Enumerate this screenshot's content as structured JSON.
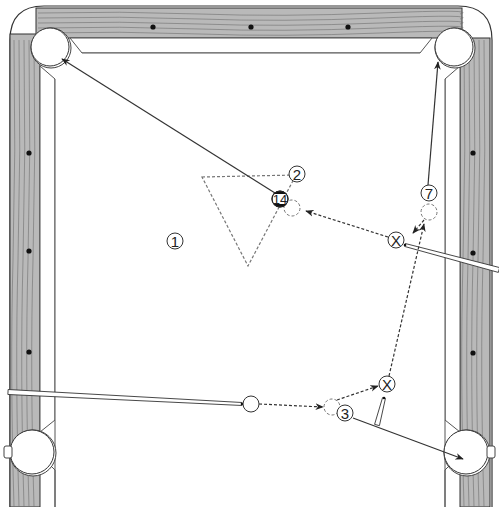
{
  "diagram": {
    "type": "billiards-shot-diagram",
    "colors": {
      "rail_wood": "#b9b9b9",
      "rail_grain": "#6e6e6e",
      "rail_outline": "#333333",
      "cloth": "#ffffff",
      "cushion_line": "#555555",
      "diamond": "#111111",
      "path_line": "#333333",
      "ghost_ball": "#777777",
      "stripe_band": "#111111"
    },
    "diamonds": {
      "top": [
        [
          153,
          27
        ],
        [
          251,
          27
        ],
        [
          348,
          27
        ]
      ],
      "left": [
        [
          29,
          153
        ],
        [
          29,
          251
        ],
        [
          29,
          352
        ]
      ],
      "right": [
        [
          473,
          153
        ],
        [
          473,
          253
        ],
        [
          473,
          353
        ]
      ]
    },
    "pockets": [
      {
        "id": "top-left",
        "cx": 50,
        "cy": 47,
        "r": 19
      },
      {
        "id": "top-right",
        "cx": 454,
        "cy": 47,
        "r": 19
      },
      {
        "id": "bottom-left",
        "cx": 32,
        "cy": 452,
        "r": 22
      },
      {
        "id": "bottom-right",
        "cx": 466,
        "cy": 452,
        "r": 22
      }
    ],
    "balls": [
      {
        "id": "ball-1",
        "label": "1",
        "cx": 175,
        "cy": 241,
        "r": 8,
        "style": "solid"
      },
      {
        "id": "ball-2",
        "label": "2",
        "cx": 297,
        "cy": 174,
        "r": 8,
        "style": "solid"
      },
      {
        "id": "ball-14",
        "label": "14",
        "cx": 280,
        "cy": 199,
        "r": 8,
        "style": "stripe"
      },
      {
        "id": "ball-7",
        "label": "7",
        "cx": 429,
        "cy": 193,
        "r": 8,
        "style": "solid"
      },
      {
        "id": "ball-3",
        "label": "3",
        "cx": 345,
        "cy": 413,
        "r": 8,
        "style": "solid"
      },
      {
        "id": "cue-ball",
        "label": "",
        "cx": 251,
        "cy": 404,
        "r": 8,
        "style": "cue"
      }
    ],
    "cue_ball_positions": [
      {
        "id": "cue-position-x-upper",
        "label": "X",
        "cx": 396,
        "cy": 240,
        "r": 8
      },
      {
        "id": "cue-position-x-lower",
        "label": "X",
        "cx": 387,
        "cy": 384,
        "r": 8
      }
    ],
    "ghost_balls": [
      {
        "id": "ghost-ball-14",
        "cx": 292,
        "cy": 208,
        "r": 8
      },
      {
        "id": "ghost-ball-7",
        "cx": 429,
        "cy": 212,
        "r": 8
      },
      {
        "id": "ghost-ball-3",
        "cx": 332,
        "cy": 407,
        "r": 8
      }
    ],
    "rack_triangle": {
      "points": [
        [
          202,
          177
        ],
        [
          296,
          175
        ],
        [
          248,
          266
        ]
      ],
      "style": "dashed"
    },
    "object_ball_paths": [
      {
        "id": "path-14-to-top-left",
        "from": [
          275,
          193
        ],
        "to": [
          62,
          59
        ],
        "style": "solid"
      },
      {
        "id": "path-7-to-top-right",
        "from": [
          428,
          185
        ],
        "to": [
          438,
          62
        ],
        "style": "solid"
      },
      {
        "id": "path-3-to-bottom-right",
        "from": [
          353,
          418
        ],
        "to": [
          463,
          459
        ],
        "style": "solid"
      }
    ],
    "cue_ball_paths": [
      {
        "id": "cue-path-1",
        "from": [
          259,
          404
        ],
        "to": [
          323,
          407
        ],
        "style": "dashed"
      },
      {
        "id": "cue-path-2",
        "from": [
          337,
          400
        ],
        "to": [
          378,
          386
        ],
        "style": "dashed"
      },
      {
        "id": "cue-path-3",
        "from": [
          389,
          376
        ],
        "to": [
          424,
          224
        ],
        "style": "dashed"
      },
      {
        "id": "cue-path-4",
        "from": [
          424,
          220
        ],
        "to": [
          413,
          233
        ],
        "style": "dashed"
      },
      {
        "id": "cue-path-5",
        "from": [
          388,
          237
        ],
        "to": [
          306,
          211
        ],
        "style": "dashed"
      }
    ],
    "cue_sticks": [
      {
        "id": "cue-stick-lower-left",
        "tip": [
          242,
          404
        ],
        "butt": [
          8,
          392
        ],
        "width": 5
      },
      {
        "id": "cue-stick-right",
        "tip": [
          405,
          245
        ],
        "butt": [
          499,
          270
        ],
        "width": 5
      },
      {
        "id": "cue-stick-short",
        "tip": [
          384,
          398
        ],
        "butt": [
          377,
          425
        ],
        "width": 5
      }
    ]
  }
}
